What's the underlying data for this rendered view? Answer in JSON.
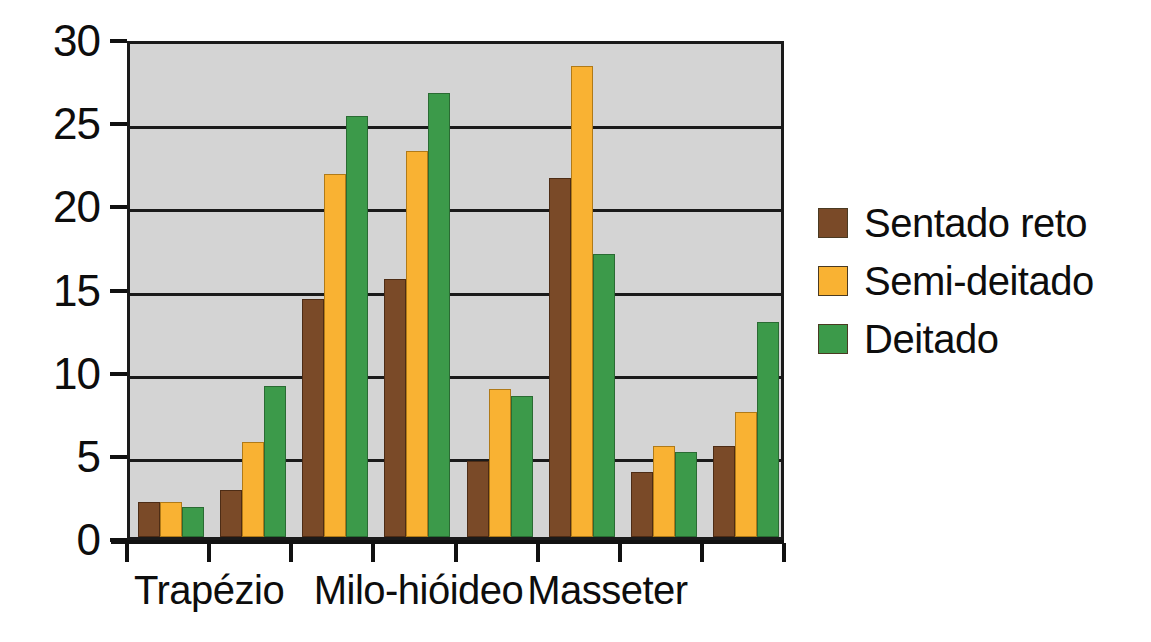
{
  "chart_data": {
    "type": "bar",
    "title": "",
    "subtitle": "",
    "xlabel": "",
    "ylabel": "",
    "ylim": [
      0,
      30
    ],
    "y_ticks": [
      0,
      5,
      10,
      15,
      20,
      25,
      30
    ],
    "y_tick_labels": [
      "0",
      "5",
      "10",
      "15",
      "20",
      "25",
      "30"
    ],
    "grid": true,
    "legend_position": "right",
    "categories": [
      "Trapézio",
      "Trapézio",
      "Milo-hióideo",
      "Milo-hióideo",
      "Masseter",
      "Masseter",
      "",
      ""
    ],
    "group_count": 8,
    "axis_labels": [
      "Trapézio",
      "Milo-hióideo",
      "Masseter"
    ],
    "series": [
      {
        "name": "Sentado reto",
        "color": "#7a4a28",
        "values": [
          2.1,
          2.8,
          14.3,
          15.5,
          4.6,
          21.6,
          3.9,
          5.5
        ]
      },
      {
        "name": "Semi-deitado",
        "color": "#f9b233",
        "values": [
          2.1,
          5.7,
          21.8,
          23.2,
          8.9,
          28.3,
          5.5,
          7.5
        ]
      },
      {
        "name": "Deitado",
        "color": "#3c9a4a",
        "values": [
          1.8,
          9.1,
          25.3,
          26.7,
          8.5,
          17.0,
          5.1,
          12.9
        ]
      }
    ]
  },
  "legend": {
    "items": [
      {
        "label": "Sentado reto",
        "color": "#7a4a28"
      },
      {
        "label": "Semi-deitado",
        "color": "#f9b233"
      },
      {
        "label": "Deitado",
        "color": "#3c9a4a"
      }
    ]
  },
  "colors": {
    "plot_background": "#d4d4d4",
    "axis": "#1a1a1a",
    "page_background": "#ffffff",
    "series_sentado_reto": "#7a4a28",
    "series_semi_deitado": "#f9b233",
    "series_deitado": "#3c9a4a"
  }
}
